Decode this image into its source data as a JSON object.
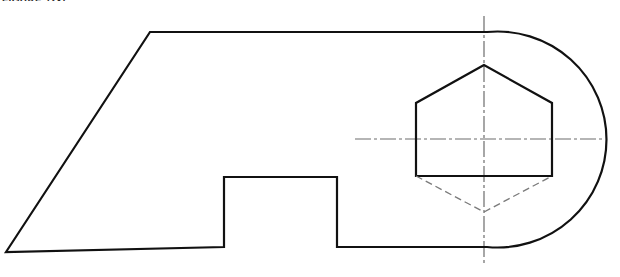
{
  "figure": {
    "caption": "FIGURE 12-1",
    "caption_visible_fraction": "clipped at top edge",
    "background_color": "#ffffff",
    "object_line_color": "#111111",
    "object_line_width": 2.2,
    "hidden_line_color": "#7a7a7a",
    "hidden_line_width": 1.3,
    "center_line_color": "#6d6d6d",
    "center_line_width": 1.2
  },
  "drawing": {
    "type": "engineering-orthographic-view",
    "canvas": {
      "width": 620,
      "height": 277
    },
    "outline": {
      "name": "part-outline",
      "description": "Closed profile: angled left face, top edge, right semicircular end, bottom edge with rectangular notch",
      "points": [
        {
          "label": "bottom-left-corner",
          "x": 6,
          "y": 252
        },
        {
          "label": "top-left-of-top-edge",
          "x": 150,
          "y": 32
        },
        {
          "label": "top-right-arc-start",
          "x": 487,
          "y": 32
        }
      ],
      "arc": {
        "label": "right-end-radius",
        "center_x": 487,
        "center_y": 139,
        "radius_x": 109,
        "radius_y": 108,
        "start_x": 487,
        "start_y": 32,
        "end_x": 487,
        "end_y": 247,
        "sweep": "clockwise-right"
      },
      "notch": {
        "label": "bottom-rectangular-notch",
        "left_x": 224,
        "right_x": 337,
        "top_y": 177,
        "bottom_y": 247
      },
      "bottom_y": 247,
      "baseline_y": 252
    },
    "hexagon": {
      "name": "hexagonal-boss",
      "visible_edges_style": "solid",
      "hidden_edges_style": "dashed",
      "center_x": 484,
      "center_y": 139,
      "points": [
        {
          "label": "apex-top",
          "x": 484,
          "y": 65,
          "style": "solid"
        },
        {
          "label": "upper-left",
          "x": 416,
          "y": 103,
          "style": "solid"
        },
        {
          "label": "lower-left",
          "x": 416,
          "y": 176,
          "style": "solid"
        },
        {
          "label": "lower-right",
          "x": 552,
          "y": 176,
          "style": "solid"
        },
        {
          "label": "upper-right",
          "x": 552,
          "y": 103,
          "style": "solid"
        }
      ],
      "hidden_vertex": {
        "label": "apex-bottom-hidden",
        "x": 484,
        "y": 212
      },
      "solid_path": "M 484 65 L 416 103 L 416 176 L 552 176 L 552 103 Z",
      "hidden_path": "M 416 176 L 484 212 L 552 176"
    },
    "center_lines": [
      {
        "name": "horizontal-center-line",
        "orientation": "horizontal",
        "x1": 355,
        "y1": 139,
        "x2": 605,
        "y2": 139
      },
      {
        "name": "vertical-center-line",
        "orientation": "vertical",
        "x1": 484,
        "y1": 16,
        "x2": 484,
        "y2": 266
      }
    ],
    "dash_patterns": {
      "hidden": "7 4",
      "center": "16 3 3 3"
    }
  }
}
